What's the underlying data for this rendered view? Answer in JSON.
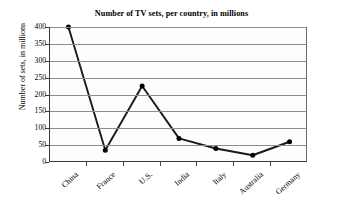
{
  "chart_data": {
    "type": "line",
    "title": "Number of TV sets, per country, in millions",
    "xlabel": "",
    "ylabel": "Number of sets, in millions",
    "categories": [
      "China",
      "France",
      "U.S.",
      "India",
      "Italy",
      "Australia",
      "Germany"
    ],
    "values": [
      400,
      35,
      225,
      70,
      40,
      20,
      60
    ],
    "series": [
      {
        "name": "Number of TV sets",
        "values": [
          400,
          35,
          225,
          70,
          40,
          20,
          60
        ]
      }
    ],
    "ylim": [
      0,
      400
    ],
    "yticks": [
      0,
      50,
      100,
      150,
      200,
      250,
      300,
      350,
      400
    ],
    "ytick_labels": [
      "0",
      "50",
      "100",
      "150",
      "200",
      "250",
      "300",
      "350",
      "400"
    ],
    "grid": true,
    "grid_axis": "y",
    "legend": false,
    "legend_position": "none",
    "marker": "filled-circle",
    "line_color": "#1a1a1a",
    "marker_color": "#000000",
    "grid_color": "#8d8d8d",
    "plot_background": "#fdfdfd",
    "annotations": []
  },
  "colors": {
    "text": "#000000",
    "axis": "#3a3a3a",
    "grid": "#8d8d8d",
    "line": "#1a1a1a",
    "background": "#ffffff"
  }
}
